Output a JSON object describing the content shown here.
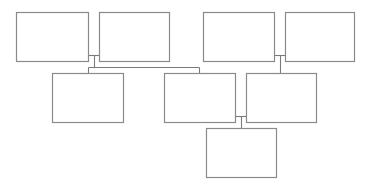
{
  "diagram": {
    "type": "family-tree",
    "nodes": [
      {
        "id": "gp1",
        "generation": 1,
        "label": ""
      },
      {
        "id": "gp2",
        "generation": 1,
        "label": ""
      },
      {
        "id": "gp3",
        "generation": 1,
        "label": ""
      },
      {
        "id": "gp4",
        "generation": 1,
        "label": ""
      },
      {
        "id": "child1",
        "generation": 2,
        "label": ""
      },
      {
        "id": "parent1",
        "generation": 2,
        "label": ""
      },
      {
        "id": "parent2",
        "generation": 2,
        "label": ""
      },
      {
        "id": "grandchild",
        "generation": 3,
        "label": ""
      }
    ],
    "couples": [
      {
        "partners": [
          "gp1",
          "gp2"
        ],
        "children": [
          "child1",
          "parent1"
        ]
      },
      {
        "partners": [
          "gp3",
          "gp4"
        ],
        "children": [
          "parent2"
        ]
      },
      {
        "partners": [
          "parent1",
          "parent2"
        ],
        "children": [
          "grandchild"
        ]
      }
    ],
    "colors": {
      "box_stroke": "#8a8a8a",
      "line": "#7a7a7a",
      "background": "#ffffff"
    }
  }
}
